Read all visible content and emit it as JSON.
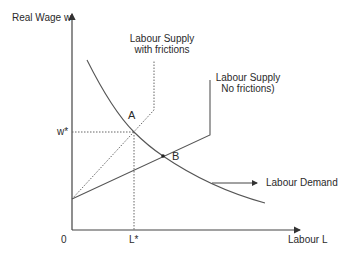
{
  "diagram": {
    "type": "economics-supply-demand",
    "axes": {
      "y_label": "Real Wage w",
      "x_label": "Labour L",
      "origin_label": "0"
    },
    "markers": {
      "w_star": "w*",
      "l_star": "L*"
    },
    "points": {
      "a_label": "A",
      "b_label": "B"
    },
    "curves": {
      "supply_frictions": {
        "line1": "Labour Supply",
        "line2": "with frictions",
        "style": "dotted"
      },
      "supply_no_frictions": {
        "line1": "Labour Supply",
        "line2": "No frictions)",
        "style": "solid"
      },
      "demand": {
        "label": "Labour Demand",
        "style": "solid"
      }
    },
    "colors": {
      "line": "#555555",
      "text": "#2a2a2a",
      "background": "#ffffff"
    }
  }
}
